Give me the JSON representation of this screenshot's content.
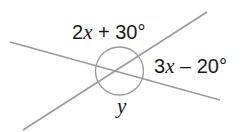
{
  "diagram": {
    "labels": {
      "top_angle": {
        "coef": "2",
        "var": "x",
        "rest": " + 30°"
      },
      "right_angle": {
        "coef": "3",
        "var": "x",
        "rest": " – 20°"
      },
      "bottom_angle": {
        "var": "y"
      }
    },
    "colors": {
      "line": "#9a9a9a",
      "text": "#1a1a1a"
    }
  }
}
